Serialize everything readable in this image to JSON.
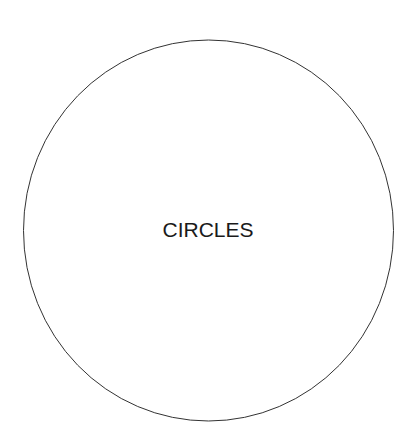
{
  "diagram": {
    "label": "CIRCLES",
    "shape": {
      "type": "ellipse",
      "cx": 208.5,
      "cy": 230.5,
      "rx": 185,
      "ry": 190.5,
      "stroke": "#333333",
      "stroke_width": 1,
      "fill": "none"
    },
    "background": "#ffffff"
  }
}
